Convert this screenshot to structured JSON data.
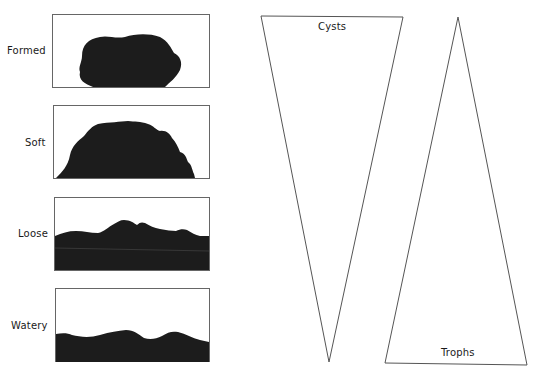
{
  "stool_panels": [
    {
      "label": "Formed"
    },
    {
      "label": "Soft"
    },
    {
      "label": "Loose"
    },
    {
      "label": "Watery"
    }
  ],
  "wedges": {
    "cysts": {
      "label": "Cysts"
    },
    "trophs": {
      "label": "Trophs"
    }
  },
  "colors": {
    "fill": "#1c1c1c",
    "stroke": "#555555",
    "background": "#ffffff"
  }
}
